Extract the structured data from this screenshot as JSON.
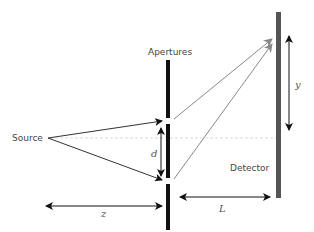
{
  "diagram": {
    "labels": {
      "source": "Source",
      "apertures": "Apertures",
      "detector": "Detector"
    },
    "variables": {
      "d": "d",
      "y": "y",
      "z": "z",
      "L": "L"
    },
    "colors": {
      "barrier": "#111111",
      "detector": "#555555",
      "source_rays": "#333333",
      "diffracted_rays": "#888888",
      "axis_dashed": "#cccccc"
    }
  }
}
